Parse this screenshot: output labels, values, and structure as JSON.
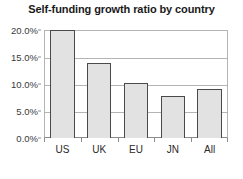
{
  "chart_data": {
    "type": "bar",
    "title": "Self-funding growth ratio by country",
    "xlabel": "",
    "ylabel": "",
    "categories": [
      "US",
      "UK",
      "EU",
      "JN",
      "All"
    ],
    "values": [
      20.0,
      13.9,
      10.2,
      7.8,
      9.0
    ],
    "value_labels": [
      "20.0%",
      "13.9%",
      "10.2%",
      "7.8%",
      "9.0%"
    ],
    "ylim": [
      0,
      20
    ],
    "ytick_values": [
      20.0,
      15.0,
      10.0,
      5.0,
      0.0
    ],
    "ytick_labels": [
      "20.0%",
      "15.0%",
      "10.0%",
      "5.0%",
      "0.0%"
    ],
    "grid": true,
    "legend": false,
    "legend_position": "none",
    "colors": {
      "bar_fill": "#e2e2e2",
      "bar_border": "#4a4a4a",
      "gridline": "#b4b4b4",
      "axis": "#8c8c8c",
      "title_text": "#1a1a1a",
      "tick_text": "#3a3a3a",
      "background": "#ffffff"
    }
  }
}
